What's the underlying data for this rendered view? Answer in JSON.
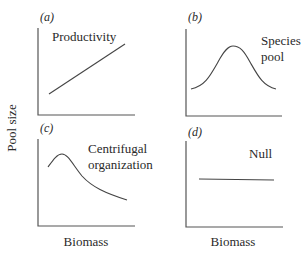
{
  "figure": {
    "y_axis_title": "Pool size",
    "x_axis_title_left": "Biomass",
    "x_axis_title_right": "Biomass",
    "panels": [
      {
        "id": "a",
        "tag": "(a)",
        "label_lines": [
          "Productivity"
        ],
        "shape": "increasing-linear"
      },
      {
        "id": "b",
        "tag": "(b)",
        "label_lines": [
          "Species",
          "pool"
        ],
        "shape": "unimodal-bell"
      },
      {
        "id": "c",
        "tag": "(c)",
        "label_lines": [
          "Centrifugal",
          "organization"
        ],
        "shape": "early-peak-decay"
      },
      {
        "id": "d",
        "tag": "(d)",
        "label_lines": [
          "Null"
        ],
        "shape": "flat"
      }
    ]
  },
  "colors": {
    "background": "#ffffff",
    "ink": "#2a2a2a",
    "axis": "#555555"
  }
}
